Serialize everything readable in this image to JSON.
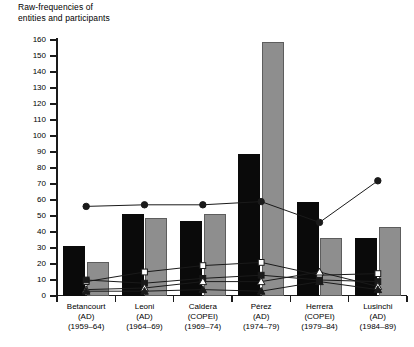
{
  "chart_data": {
    "type": "bar",
    "title": "Raw-frequencies of\nentities and participants",
    "xlabel": "",
    "ylabel": "",
    "ylim": [
      0,
      160
    ],
    "ytick_step": 10,
    "grid": false,
    "legend": "none",
    "categories": [
      "Betancourt\n(AD)\n(1959–64)",
      "Leoni\n(AD)\n(1964–69)",
      "Caldera\n(COPEI)\n(1969–74)",
      "Pérez\n(AD)\n(1974–79)",
      "Herrera\n(COPEI)\n(1979–84)",
      "Lusinchi\n(AD)\n(1984–89)"
    ],
    "category_names": [
      "Betancourt",
      "Leoni",
      "Caldera",
      "Pérez",
      "Herrera",
      "Lusinchi"
    ],
    "category_parties": [
      "(AD)",
      "(AD)",
      "(COPEI)",
      "(AD)",
      "(COPEI)",
      "(AD)"
    ],
    "category_periods": [
      "(1959–64)",
      "(1964–69)",
      "(1969–74)",
      "(1974–79)",
      "(1979–84)",
      "(1984–89)"
    ],
    "series": [
      {
        "name": "bar-black",
        "kind": "bar",
        "color": "#0a0a0a",
        "values": [
          31,
          51,
          47,
          89,
          59,
          36
        ]
      },
      {
        "name": "bar-gray",
        "kind": "bar",
        "color": "#8e8e8e",
        "values": [
          21,
          49,
          51,
          159,
          36,
          43
        ]
      },
      {
        "name": "line-filled-circle",
        "kind": "line",
        "marker": "circle-filled",
        "color": "#1a1a1a",
        "values": [
          56,
          57,
          57,
          59,
          46,
          72
        ]
      },
      {
        "name": "line-open-square",
        "kind": "line",
        "marker": "square-open",
        "color": "#1a1a1a",
        "values": [
          9,
          15,
          19,
          21,
          13,
          14
        ]
      },
      {
        "name": "line-filled-square",
        "kind": "line",
        "marker": "square-filled",
        "color": "#1a1a1a",
        "values": [
          10,
          8,
          11,
          13,
          10,
          9
        ]
      },
      {
        "name": "line-open-triangle",
        "kind": "line",
        "marker": "triangle-open",
        "color": "#1a1a1a",
        "values": [
          4,
          5,
          9,
          9,
          15,
          6
        ]
      },
      {
        "name": "line-filled-triangle",
        "kind": "line",
        "marker": "triangle-filled",
        "color": "#1a1a1a",
        "values": [
          3,
          3,
          4,
          3,
          9,
          4
        ]
      }
    ],
    "ytick_labels": [
      "0",
      "10",
      "20",
      "30",
      "40",
      "50",
      "60",
      "70",
      "80",
      "90",
      "100",
      "110",
      "120",
      "130",
      "140",
      "150",
      "160"
    ]
  }
}
